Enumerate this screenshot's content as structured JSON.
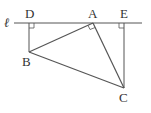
{
  "figure": {
    "line_label": "ℓ",
    "points": {
      "A": {
        "label": "A",
        "x": 93,
        "y": 23
      },
      "B": {
        "label": "B",
        "x": 29,
        "y": 52
      },
      "C": {
        "label": "C",
        "x": 124,
        "y": 88
      },
      "D": {
        "label": "D",
        "x": 29,
        "y": 23
      },
      "E": {
        "label": "E",
        "x": 124,
        "y": 23
      }
    },
    "segments": [
      "line ℓ",
      "DB",
      "EC",
      "AB",
      "AC",
      "BC"
    ],
    "right_angles": [
      "D",
      "E",
      "A"
    ],
    "stroke_color": "#555555"
  }
}
